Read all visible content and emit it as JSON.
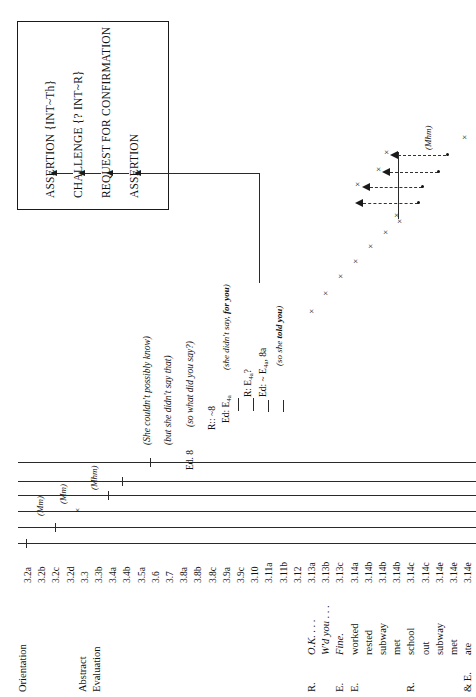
{
  "figure": {
    "type": "conversation-analysis-diagram",
    "orientation": "rotated-90-counterclockwise"
  },
  "legend_box": {
    "items": [
      "ASSERTION  {INT~Th}",
      "CHALLENGE {? INT~R}",
      "REQUEST FOR CONFIRMATION",
      "ASSERTION"
    ]
  },
  "annotations": {
    "italic_notes": [
      "(She couldn't possibly know)",
      "(but she didn't say that)",
      "(so what did you say?)",
      "(she didn't say, for you)",
      "(so she told you)"
    ],
    "formulas": [
      "Ed. 8",
      "R:: ~8",
      "Ed: E4a",
      "R: E4a?",
      "Ed: ~ E4a, 8a"
    ],
    "backchannels": [
      "(Mm)",
      "(Mm)",
      "(Mhm)",
      "(Mhm)"
    ]
  },
  "structure_labels": [
    {
      "name": "Orientation"
    },
    {
      "name": "Abstract"
    },
    {
      "name": "Evaluation"
    }
  ],
  "turn_numbers": [
    "3.2a",
    "3.2b",
    "3.2c",
    "3.2d",
    "3.3",
    "3.3b",
    "3.4a",
    "3.4b",
    "3.5a",
    "3.6",
    "3.7",
    "3.8a",
    "3.8b",
    "3.8c",
    "3.9a",
    "3.9c",
    "3.10",
    "3.11a",
    "3.11b",
    "3.12",
    "3.13a",
    "3.13b",
    "3.13c",
    "3.14a",
    "3.14b",
    "3.14b",
    "3.14b",
    "3.14c",
    "3.14c",
    "3.14e",
    "3.14e",
    "3.14e"
  ],
  "transcript": [
    {
      "speaker": "R.",
      "text": "O.K. . . ."
    },
    {
      "speaker": "",
      "text": "W'd you . . ."
    },
    {
      "speaker": "E.",
      "text": "Fine."
    },
    {
      "speaker": "E.",
      "text": "worked"
    },
    {
      "speaker": "",
      "text": "rested"
    },
    {
      "speaker": "",
      "text": "subway"
    },
    {
      "speaker": "",
      "text": "met"
    },
    {
      "speaker": "R.",
      "text": "school"
    },
    {
      "speaker": "",
      "text": "out"
    },
    {
      "speaker": "",
      "text": "subway"
    },
    {
      "speaker": "",
      "text": "met"
    },
    {
      "speaker": "& E.",
      "text": "ate"
    }
  ],
  "colors": {
    "ink": "#1a1a1a",
    "line": "#2a2a2a",
    "paper": "#ffffff"
  },
  "marks": {
    "x_glyph": "×",
    "x_count": 12,
    "arrow_count": 4
  }
}
